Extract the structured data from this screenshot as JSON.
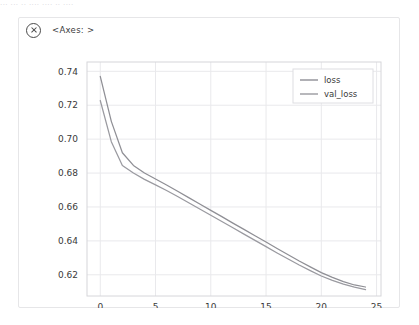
{
  "top_strip_text": "··· ··· ·· ···· ···· ·· ····",
  "card": {
    "close_icon": "circled-x-icon",
    "axes_label": "<Axes: >"
  },
  "chart_data": {
    "type": "line",
    "title": "",
    "xlabel": "",
    "ylabel": "",
    "xlim": [
      -1.2,
      25.4
    ],
    "ylim": [
      0.6075,
      0.7455
    ],
    "xticks": [
      0,
      5,
      10,
      15,
      20,
      25
    ],
    "xtick_labels": [
      "0",
      "5",
      "10",
      "15",
      "20",
      "25"
    ],
    "yticks": [
      0.62,
      0.64,
      0.66,
      0.68,
      0.7,
      0.72,
      0.74
    ],
    "ytick_labels": [
      "0.62",
      "0.64",
      "0.66",
      "0.68",
      "0.70",
      "0.72",
      "0.74"
    ],
    "grid": true,
    "grid_color": "#e9e9ec",
    "legend_position": "upper right",
    "x": [
      0,
      1,
      2,
      3,
      4,
      5,
      6,
      7,
      8,
      9,
      10,
      11,
      12,
      13,
      14,
      15,
      16,
      17,
      18,
      19,
      20,
      21,
      22,
      23,
      24
    ],
    "series": [
      {
        "name": "loss",
        "color": "#8f8f95",
        "values": [
          0.737,
          0.7105,
          0.692,
          0.6845,
          0.68,
          0.6765,
          0.673,
          0.6693,
          0.6655,
          0.6618,
          0.658,
          0.6543,
          0.6505,
          0.6468,
          0.643,
          0.6393,
          0.6355,
          0.6318,
          0.6281,
          0.6247,
          0.6213,
          0.6185,
          0.616,
          0.614,
          0.6128
        ]
      },
      {
        "name": "val_loss",
        "color": "#9a9aa0",
        "values": [
          0.7228,
          0.6985,
          0.6845,
          0.68,
          0.6763,
          0.673,
          0.6697,
          0.6662,
          0.6625,
          0.6588,
          0.6551,
          0.6514,
          0.6477,
          0.644,
          0.6403,
          0.6366,
          0.6329,
          0.6293,
          0.6258,
          0.6225,
          0.6193,
          0.6167,
          0.6145,
          0.6127,
          0.6113
        ]
      }
    ]
  }
}
